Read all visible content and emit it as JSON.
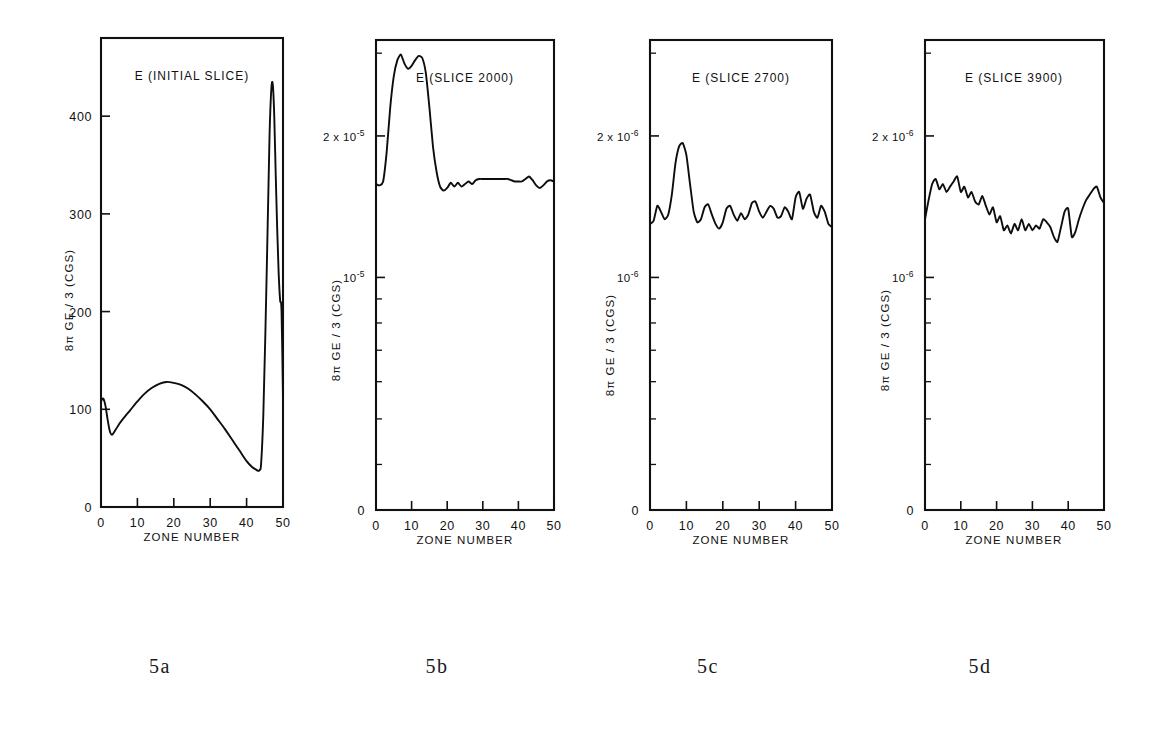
{
  "figure": {
    "background_color": "#ffffff",
    "ink_color": "#111111",
    "captions": [
      {
        "label": "5a",
        "x": 160
      },
      {
        "label": "5b",
        "x": 437
      },
      {
        "label": "5c",
        "x": 708
      },
      {
        "label": "5d",
        "x": 980
      }
    ]
  },
  "chart_data": [
    {
      "type": "line",
      "panel_id": "5a",
      "title": "E (INITIAL SLICE)",
      "xlabel": "ZONE NUMBER",
      "ylabel": "8π GE / 3 (CGS)",
      "yscale": "linear",
      "xlim": [
        0,
        50
      ],
      "ylim": [
        0,
        480
      ],
      "xticks": [
        0,
        10,
        20,
        30,
        40,
        50
      ],
      "xticklabels": [
        "0",
        "10",
        "20",
        "30",
        "40",
        "50"
      ],
      "yticks": [
        0,
        100,
        200,
        300,
        400
      ],
      "yticklabels": [
        "0",
        "100",
        "200",
        "300",
        "400"
      ],
      "grid": false,
      "legend": "none",
      "x": [
        0,
        0.6,
        1.2,
        1.8,
        2.4,
        3.0,
        4.0,
        5.0,
        6.0,
        8.0,
        10.0,
        12.0,
        14.0,
        16.0,
        18.0,
        20.0,
        22.0,
        24.0,
        26.0,
        28.0,
        30.0,
        32.0,
        34.0,
        36.0,
        38.0,
        40.0,
        41.5,
        42.7,
        43.2,
        43.6,
        44.0,
        44.6,
        45.2,
        45.8,
        46.3,
        46.8,
        47.2,
        47.6,
        48.0,
        48.4,
        48.8,
        49.2,
        49.6,
        50.0
      ],
      "y": [
        108,
        111,
        104,
        90,
        78,
        74,
        79,
        85,
        90,
        99,
        108,
        116,
        122,
        126,
        128,
        127,
        125,
        121,
        115,
        108,
        100,
        90,
        80,
        69,
        58,
        47,
        41,
        38,
        37,
        38,
        45,
        95,
        185,
        290,
        380,
        428,
        432,
        400,
        340,
        285,
        240,
        212,
        200,
        112
      ]
    },
    {
      "type": "line",
      "panel_id": "5b",
      "title": "E (SLICE 2000)",
      "xlabel": "ZONE NUMBER",
      "ylabel": "8π GE / 3 (CGS)",
      "yscale": "log",
      "xlim": [
        0,
        50
      ],
      "ylim": [
        3.2e-06,
        3.2e-05
      ],
      "xticks": [
        0,
        10,
        20,
        30,
        40,
        50
      ],
      "xticklabels": [
        "0",
        "10",
        "20",
        "30",
        "40",
        "50"
      ],
      "yticks": [
        2e-05,
        1e-05
      ],
      "yticklabels": [
        "2 x 10-5",
        "10-5"
      ],
      "ytick_mantissa": [
        "2 x 10",
        "10"
      ],
      "ytick_exponent": [
        "-5",
        "-5"
      ],
      "zero_label": "0",
      "grid": false,
      "legend": "none",
      "x": [
        0,
        1,
        2,
        3,
        4,
        5,
        6,
        7,
        8,
        9,
        10,
        11,
        12,
        13,
        14,
        15,
        16,
        17,
        18,
        19,
        20,
        21,
        22,
        23,
        24,
        25,
        26,
        27,
        28,
        29,
        30,
        31,
        32,
        33,
        34,
        35,
        36,
        37,
        38,
        39,
        40,
        41,
        42,
        43,
        44,
        45,
        46,
        47,
        48,
        49,
        50
      ],
      "y": [
        1.58e-05,
        1.57e-05,
        1.6e-05,
        1.85e-05,
        2.3e-05,
        2.68e-05,
        2.9e-05,
        2.98e-05,
        2.85e-05,
        2.78e-05,
        2.82e-05,
        2.9e-05,
        2.96e-05,
        2.93e-05,
        2.72e-05,
        2.3e-05,
        1.9e-05,
        1.68e-05,
        1.56e-05,
        1.53e-05,
        1.55e-05,
        1.59e-05,
        1.56e-05,
        1.59e-05,
        1.56e-05,
        1.58e-05,
        1.6e-05,
        1.58e-05,
        1.61e-05,
        1.62e-05,
        1.62e-05,
        1.62e-05,
        1.62e-05,
        1.62e-05,
        1.62e-05,
        1.62e-05,
        1.62e-05,
        1.62e-05,
        1.61e-05,
        1.6e-05,
        1.6e-05,
        1.6e-05,
        1.62e-05,
        1.64e-05,
        1.61e-05,
        1.57e-05,
        1.55e-05,
        1.57e-05,
        1.6e-05,
        1.61e-05,
        1.6e-05
      ]
    },
    {
      "type": "line",
      "panel_id": "5c",
      "title": "E (SLICE 2700)",
      "xlabel": "ZONE NUMBER",
      "ylabel": "8π GE / 3 (CGS)",
      "yscale": "log",
      "xlim": [
        0,
        50
      ],
      "ylim": [
        3.2e-07,
        3.2e-06
      ],
      "xticks": [
        0,
        10,
        20,
        30,
        40,
        50
      ],
      "xticklabels": [
        "0",
        "10",
        "20",
        "30",
        "40",
        "50"
      ],
      "yticks": [
        2e-06,
        1e-06
      ],
      "yticklabels": [
        "2 x 10-6",
        "10-6"
      ],
      "ytick_mantissa": [
        "2 x 10",
        "10"
      ],
      "ytick_exponent": [
        "-6",
        "-6"
      ],
      "zero_label": "0",
      "grid": false,
      "legend": "none",
      "x": [
        0,
        1,
        2,
        3,
        4,
        5,
        6,
        7,
        8,
        9,
        10,
        11,
        12,
        13,
        14,
        15,
        16,
        17,
        18,
        19,
        20,
        21,
        22,
        23,
        24,
        25,
        26,
        27,
        28,
        29,
        30,
        31,
        32,
        33,
        34,
        35,
        36,
        37,
        38,
        39,
        40,
        41,
        42,
        43,
        44,
        45,
        46,
        47,
        48,
        49,
        50
      ],
      "y": [
        1.3e-06,
        1.32e-06,
        1.42e-06,
        1.38e-06,
        1.33e-06,
        1.36e-06,
        1.5e-06,
        1.75e-06,
        1.9e-06,
        1.93e-06,
        1.82e-06,
        1.58e-06,
        1.38e-06,
        1.31e-06,
        1.33e-06,
        1.41e-06,
        1.43e-06,
        1.36e-06,
        1.3e-06,
        1.27e-06,
        1.31e-06,
        1.4e-06,
        1.42e-06,
        1.36e-06,
        1.32e-06,
        1.37e-06,
        1.33e-06,
        1.36e-06,
        1.44e-06,
        1.45e-06,
        1.38e-06,
        1.34e-06,
        1.38e-06,
        1.42e-06,
        1.4e-06,
        1.34e-06,
        1.35e-06,
        1.41e-06,
        1.38e-06,
        1.33e-06,
        1.48e-06,
        1.52e-06,
        1.4e-06,
        1.47e-06,
        1.5e-06,
        1.38e-06,
        1.34e-06,
        1.42e-06,
        1.38e-06,
        1.3e-06,
        1.28e-06
      ]
    },
    {
      "type": "line",
      "panel_id": "5d",
      "title": "E (SLICE 3900)",
      "xlabel": "ZONE NUMBER",
      "ylabel": "8π GE / 3 (CGS)",
      "yscale": "log",
      "xlim": [
        0,
        50
      ],
      "ylim": [
        3.2e-07,
        3.2e-06
      ],
      "xticks": [
        0,
        10,
        20,
        30,
        40,
        50
      ],
      "xticklabels": [
        "0",
        "10",
        "20",
        "30",
        "40",
        "50"
      ],
      "yticks": [
        2e-06,
        1e-06
      ],
      "yticklabels": [
        "2 x 10-6",
        "10-6"
      ],
      "ytick_mantissa": [
        "2 x 10",
        "10"
      ],
      "ytick_exponent": [
        "-6",
        "-6"
      ],
      "zero_label": "0",
      "grid": false,
      "legend": "none",
      "x": [
        0,
        1,
        2,
        3,
        4,
        5,
        6,
        7,
        8,
        9,
        10,
        11,
        12,
        13,
        14,
        15,
        16,
        17,
        18,
        19,
        20,
        21,
        22,
        23,
        24,
        25,
        26,
        27,
        28,
        29,
        30,
        31,
        32,
        33,
        34,
        35,
        36,
        37,
        38,
        39,
        40,
        41,
        42,
        43,
        44,
        45,
        46,
        47,
        48,
        49,
        50
      ],
      "y": [
        1.33e-06,
        1.46e-06,
        1.58e-06,
        1.62e-06,
        1.54e-06,
        1.58e-06,
        1.52e-06,
        1.56e-06,
        1.6e-06,
        1.64e-06,
        1.52e-06,
        1.56e-06,
        1.48e-06,
        1.52e-06,
        1.45e-06,
        1.43e-06,
        1.49e-06,
        1.42e-06,
        1.36e-06,
        1.41e-06,
        1.31e-06,
        1.35e-06,
        1.26e-06,
        1.29e-06,
        1.24e-06,
        1.3e-06,
        1.26e-06,
        1.33e-06,
        1.26e-06,
        1.3e-06,
        1.26e-06,
        1.29e-06,
        1.27e-06,
        1.33e-06,
        1.31e-06,
        1.28e-06,
        1.22e-06,
        1.19e-06,
        1.28e-06,
        1.38e-06,
        1.4e-06,
        1.22e-06,
        1.25e-06,
        1.33e-06,
        1.4e-06,
        1.46e-06,
        1.5e-06,
        1.54e-06,
        1.56e-06,
        1.48e-06,
        1.44e-06
      ]
    }
  ]
}
